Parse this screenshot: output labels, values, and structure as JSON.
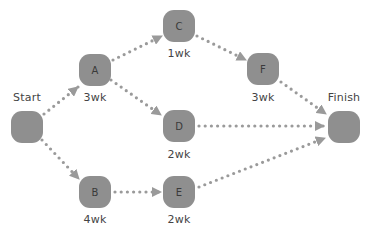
{
  "diagram": {
    "type": "network-schedule",
    "colors": {
      "node_fill": "#8f8f8f",
      "node_text": "#3a3a3a",
      "edge": "#9a9a9a",
      "label_text": "#444444",
      "background": "#ffffff"
    },
    "nodes": [
      {
        "id": "start",
        "letter": "",
        "label": "Start",
        "duration": ""
      },
      {
        "id": "a",
        "letter": "A",
        "label": "",
        "duration": "3wk"
      },
      {
        "id": "b",
        "letter": "B",
        "label": "",
        "duration": "4wk"
      },
      {
        "id": "c",
        "letter": "C",
        "label": "",
        "duration": "1wk"
      },
      {
        "id": "d",
        "letter": "D",
        "label": "",
        "duration": "2wk"
      },
      {
        "id": "e",
        "letter": "E",
        "label": "",
        "duration": "2wk"
      },
      {
        "id": "f",
        "letter": "F",
        "label": "",
        "duration": "3wk"
      },
      {
        "id": "finish",
        "letter": "",
        "label": "Finish",
        "duration": ""
      }
    ],
    "edges": [
      {
        "from": "Start",
        "to": "A"
      },
      {
        "from": "Start",
        "to": "B"
      },
      {
        "from": "A",
        "to": "C"
      },
      {
        "from": "A",
        "to": "D"
      },
      {
        "from": "C",
        "to": "F"
      },
      {
        "from": "B",
        "to": "E"
      },
      {
        "from": "F",
        "to": "Finish"
      },
      {
        "from": "D",
        "to": "Finish"
      },
      {
        "from": "E",
        "to": "Finish"
      }
    ]
  }
}
